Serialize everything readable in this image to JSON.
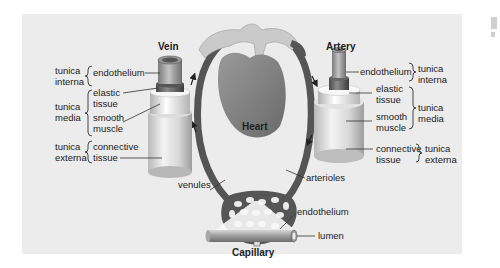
{
  "diagram": {
    "center_label": "Heart",
    "vein": {
      "title": "Vein",
      "layers": [
        {
          "tunica": "tunica interna",
          "tunica_lines": [
            "tunica",
            "interna"
          ],
          "components": [
            "endothelium"
          ]
        },
        {
          "tunica": "tunica media",
          "tunica_lines": [
            "tunica",
            "media"
          ],
          "components": [
            "elastic tissue",
            "smooth muscle"
          ]
        },
        {
          "tunica": "tunica externa",
          "tunica_lines": [
            "tunica",
            "externa"
          ],
          "components": [
            "connective tissue"
          ]
        }
      ]
    },
    "artery": {
      "title": "Artery",
      "layers": [
        {
          "tunica": "tunica interna",
          "tunica_lines": [
            "tunica",
            "interna"
          ],
          "components": [
            "endothelium"
          ]
        },
        {
          "tunica": "tunica media",
          "tunica_lines": [
            "tunica",
            "media"
          ],
          "components": [
            "elastic tissue",
            "smooth muscle"
          ]
        },
        {
          "tunica": "tunica externa",
          "tunica_lines": [
            "tunica",
            "externa"
          ],
          "components": [
            "connective tissue"
          ]
        }
      ]
    },
    "capillary_bed": {
      "left_label": "venules",
      "right_label": "arterioles"
    },
    "capillary": {
      "title": "Capillary",
      "labels": [
        "endothelium",
        "lumen"
      ]
    },
    "text": {
      "t_tunica": "tunica",
      "t_interna": "interna",
      "t_media": "media",
      "t_externa": "externa",
      "endothelium": "endothelium",
      "elastic": "elastic",
      "tissue": "tissue",
      "smooth": "smooth",
      "muscle": "muscle",
      "connective": "connective",
      "vein": "Vein",
      "artery": "Artery",
      "heart": "Heart",
      "venules": "venules",
      "arterioles": "arterioles",
      "capillary": "Capillary",
      "lumen": "lumen"
    },
    "colors": {
      "panel_bg": "#ececec",
      "vessel_dark": "#555555",
      "heart": "#7a7a7a",
      "great_vessels": "#c9c9c9"
    }
  }
}
